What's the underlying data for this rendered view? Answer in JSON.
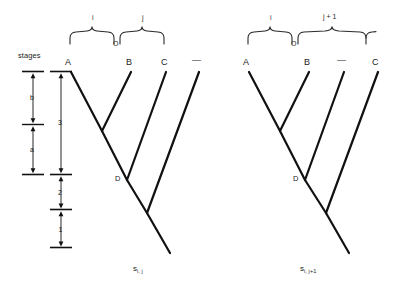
{
  "figure": {
    "type": "phylogenetic-tree-diagram",
    "background_color": "#ffffff",
    "line_color": "#111111",
    "brace_color": "#2a2a2a",
    "width": 401,
    "height": 298
  },
  "scale": {
    "title": "stages",
    "inner_column": {
      "segments": [
        {
          "label": "b",
          "top": 74,
          "bottom": 122
        },
        {
          "label": "a",
          "top": 127,
          "bottom": 172
        }
      ],
      "tick_x_center": 33,
      "tick_half_width": 11
    },
    "outer_column": {
      "segments": [
        {
          "label": "3",
          "top": 74,
          "bottom": 172
        },
        {
          "label": "2",
          "top": 176,
          "bottom": 208
        },
        {
          "label": "1",
          "top": 212,
          "bottom": 247
        }
      ],
      "tick_x_center": 61,
      "tick_half_width": 11
    }
  },
  "trees": [
    {
      "id": "tree-left",
      "caption": "s",
      "caption_subscript": "i, j",
      "caption_x": 133,
      "caption_y": 268,
      "leaves": [
        {
          "label": "A",
          "x": 68,
          "y": 64
        },
        {
          "label": "B",
          "x": 129,
          "y": 64
        },
        {
          "label": "C",
          "x": 164,
          "y": 64
        },
        {
          "label": "—",
          "x": 196,
          "y": 63
        }
      ],
      "internal_nodes": [
        {
          "label": "",
          "x": 102,
          "y": 131
        },
        {
          "label": "D",
          "x": 127,
          "y": 180
        },
        {
          "label": "",
          "x": 147,
          "y": 213
        }
      ],
      "braces": [
        {
          "label": "i",
          "left_x": 70,
          "right_x": 116,
          "label_x": 92,
          "label_y": 14,
          "apex_y": 29,
          "arm_y": 44
        },
        {
          "label": "j",
          "left_x": 120,
          "right_x": 166,
          "label_x": 142,
          "label_y": 14,
          "apex_y": 29,
          "arm_y": 44
        }
      ],
      "brace_join_label": {
        "text": "O",
        "x": 116,
        "y": 45
      }
    },
    {
      "id": "tree-right",
      "caption": "s",
      "caption_subscript": "i, j+1",
      "caption_x": 300,
      "caption_y": 268,
      "leaves": [
        {
          "label": "A",
          "x": 246,
          "y": 64
        },
        {
          "label": "B",
          "x": 307,
          "y": 64
        },
        {
          "label": "—",
          "x": 341,
          "y": 63
        },
        {
          "label": "C",
          "x": 375,
          "y": 64
        }
      ],
      "internal_nodes": [
        {
          "label": "",
          "x": 280,
          "y": 131
        },
        {
          "label": "D",
          "x": 305,
          "y": 180
        },
        {
          "label": "",
          "x": 326,
          "y": 213
        }
      ],
      "braces": [
        {
          "label": "i",
          "left_x": 248,
          "right_x": 294,
          "label_x": 270,
          "label_y": 14,
          "apex_y": 29,
          "arm_y": 44
        },
        {
          "label": "j + 1",
          "left_x": 298,
          "right_x": 380,
          "label_x": 330,
          "label_y": 13,
          "apex_y": 29,
          "arm_y": 44
        }
      ],
      "brace_join_label": {
        "text": "O",
        "x": 294,
        "y": 45
      }
    }
  ]
}
